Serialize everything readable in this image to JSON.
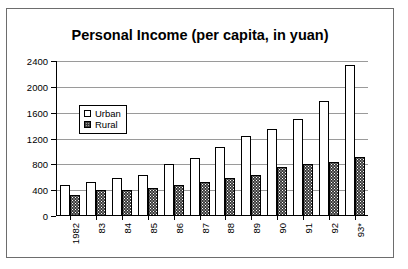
{
  "chart_data": {
    "type": "bar",
    "title": "Personal Income (per capita, in yuan)",
    "xlabel": "",
    "ylabel": "",
    "ylim": [
      0,
      2400
    ],
    "yticks": [
      0,
      400,
      800,
      1200,
      1600,
      2000,
      2400
    ],
    "ytick_labels": [
      "0",
      "400",
      "800",
      "1200",
      "1600",
      "2000",
      "2400"
    ],
    "grid": true,
    "legend_position": "upper-left-inside",
    "categories": [
      "1982",
      "83",
      "84",
      "85",
      "86",
      "87",
      "88",
      "89",
      "90",
      "91",
      "92",
      "93*"
    ],
    "series": [
      {
        "name": "Urban",
        "values": [
          480,
          530,
          590,
          630,
          800,
          900,
          1070,
          1240,
          1350,
          1500,
          1780,
          2340
        ]
      },
      {
        "name": "Rural",
        "values": [
          330,
          400,
          400,
          440,
          480,
          520,
          590,
          630,
          760,
          800,
          830,
          910
        ]
      }
    ]
  },
  "legend": {
    "items": [
      {
        "label": "Urban",
        "swatch": "hollow-square-icon"
      },
      {
        "label": "Rural",
        "swatch": "stippled-square-icon"
      }
    ]
  }
}
